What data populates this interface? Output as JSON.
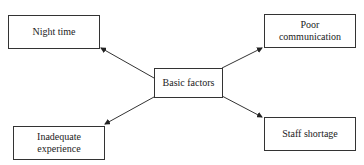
{
  "diagram": {
    "center": {
      "label": "Basic factors"
    },
    "nodes": [
      {
        "id": "night-time",
        "label": "Night time"
      },
      {
        "id": "poor-communication",
        "label": "Poor communication"
      },
      {
        "id": "inadequate-experience",
        "label": "Inadequate experience"
      },
      {
        "id": "staff-shortage",
        "label": "Staff shortage"
      }
    ],
    "edges": [
      {
        "from": "Basic factors",
        "to": "Night time"
      },
      {
        "from": "Basic factors",
        "to": "Poor communication"
      },
      {
        "from": "Basic factors",
        "to": "Inadequate experience"
      },
      {
        "from": "Basic factors",
        "to": "Staff shortage"
      }
    ],
    "colors": {
      "line": "#333333",
      "text": "#222222",
      "background": "#ffffff"
    }
  }
}
